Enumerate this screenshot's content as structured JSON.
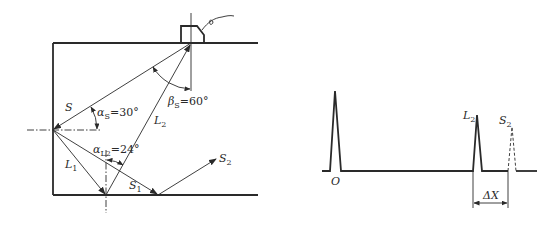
{
  "left_diagram": {
    "title": "Mode conversion in block with probe",
    "labels": {
      "S": "S",
      "alpha_s": "α",
      "alpha_s_sub": "S",
      "alpha_s_val": "=30°",
      "beta_s": "β",
      "beta_s_sub": "S",
      "beta_s_val": "=60°",
      "L2": "L",
      "L2_sub": "2",
      "alpha_l2": "α",
      "alpha_l2_sub": "L2",
      "alpha_l2_val": "=24°",
      "L1": "L",
      "L1_sub": "1",
      "S1": "S",
      "S1_sub": "1",
      "S2": "S",
      "S2_sub": "2"
    },
    "angles": {
      "alpha_S_deg": 30,
      "beta_S_deg": 60,
      "alpha_L2_deg": 24
    }
  },
  "right_diagram": {
    "title": "A-scan echo display",
    "labels": {
      "origin": "O",
      "L2": "L",
      "L2_sub": "2",
      "S2": "S",
      "S2_sub": "2",
      "delta_x": "ΔX"
    },
    "peaks": [
      {
        "name": "O",
        "style": "solid"
      },
      {
        "name": "L2",
        "style": "solid"
      },
      {
        "name": "S2",
        "style": "dashed"
      }
    ]
  },
  "colors": {
    "line": "#2a2a2a",
    "background": "#ffffff"
  }
}
